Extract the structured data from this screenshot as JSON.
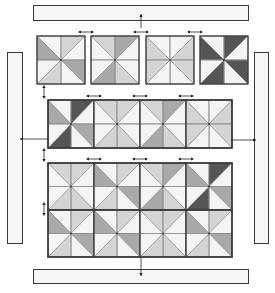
{
  "diagram": {
    "colors": {
      "background": "#ffffff",
      "outline": "#3a3a3a",
      "seam": "#8a8a8a",
      "border_fill": "#f6f6f6",
      "white": "#f4f4f4",
      "light": "#d4d4d4",
      "medium": "#a9a9a9",
      "dark": "#555555",
      "arrow": "#222222"
    },
    "borders": [
      {
        "id": "top-border",
        "x": 33,
        "y": 5,
        "w": 215,
        "h": 15
      },
      {
        "id": "left-border",
        "x": 7,
        "y": 52,
        "w": 15,
        "h": 191
      },
      {
        "id": "right-border",
        "x": 254,
        "y": 52,
        "w": 14,
        "h": 191
      },
      {
        "id": "bottom-border",
        "x": 33,
        "y": 269,
        "w": 215,
        "h": 14
      }
    ],
    "block_rows": [
      {
        "id": "row-1-separate-blocks",
        "y": 36,
        "size": 48,
        "joined": false,
        "blocks": [
          {
            "x": 37,
            "shade": [
              "medium",
              "white",
              "light",
              "white",
              "medium",
              "white",
              "light",
              "white"
            ]
          },
          {
            "x": 91,
            "shade": [
              "white",
              "light",
              "medium",
              "white",
              "white",
              "light",
              "medium",
              "white"
            ]
          },
          {
            "x": 146,
            "shade": [
              "light",
              "white",
              "white",
              "light",
              "light",
              "white",
              "white",
              "light"
            ]
          },
          {
            "x": 200,
            "shade": [
              "dark",
              "white",
              "dark",
              "white",
              "dark",
              "white",
              "dark",
              "white"
            ]
          }
        ]
      },
      {
        "id": "row-2-joined-strip",
        "y": 100,
        "size": 48,
        "joined": true,
        "x": 48,
        "block_w": 46,
        "blocks": [
          {
            "shade": [
              "medium",
              "white",
              "dark",
              "white",
              "medium",
              "white",
              "dark",
              "white"
            ]
          },
          {
            "shade": [
              "white",
              "light",
              "light",
              "white",
              "white",
              "light",
              "light",
              "white"
            ]
          },
          {
            "shade": [
              "white",
              "light",
              "medium",
              "white",
              "white",
              "light",
              "medium",
              "white"
            ]
          },
          {
            "shade": [
              "light",
              "white",
              "white",
              "light",
              "light",
              "white",
              "white",
              "light"
            ]
          }
        ]
      },
      {
        "id": "row-3-joined-strip",
        "y": 163,
        "size": 47,
        "joined": true,
        "x": 48,
        "block_w": 46,
        "blocks": [
          {
            "shade": [
              "white",
              "light",
              "light",
              "white",
              "white",
              "light",
              "light",
              "white"
            ]
          },
          {
            "shade": [
              "medium",
              "white",
              "light",
              "white",
              "medium",
              "white",
              "light",
              "white"
            ]
          },
          {
            "shade": [
              "white",
              "light",
              "medium",
              "white",
              "white",
              "light",
              "medium",
              "white"
            ]
          },
          {
            "shade": [
              "medium",
              "white",
              "dark",
              "white",
              "medium",
              "white",
              "dark",
              "white"
            ]
          }
        ]
      },
      {
        "id": "row-4-joined-strip",
        "y": 210,
        "size": 47,
        "joined": true,
        "x": 48,
        "block_w": 46,
        "blocks": [
          {
            "shade": [
              "medium",
              "white",
              "light",
              "white",
              "medium",
              "white",
              "light",
              "white"
            ]
          },
          {
            "shade": [
              "medium",
              "white",
              "light",
              "white",
              "medium",
              "white",
              "light",
              "white"
            ]
          },
          {
            "shade": [
              "white",
              "light",
              "light",
              "white",
              "white",
              "light",
              "light",
              "white"
            ]
          },
          {
            "shade": [
              "medium",
              "white",
              "light",
              "white",
              "medium",
              "white",
              "light",
              "white"
            ]
          }
        ]
      }
    ],
    "arrows": {
      "horizontal_pairs": [
        {
          "x": 86,
          "y": 32
        },
        {
          "x": 141,
          "y": 32
        },
        {
          "x": 195,
          "y": 32
        },
        {
          "x": 94,
          "y": 96
        },
        {
          "x": 140,
          "y": 96
        },
        {
          "x": 186,
          "y": 96
        },
        {
          "x": 94,
          "y": 159
        },
        {
          "x": 140,
          "y": 159
        },
        {
          "x": 186,
          "y": 159
        }
      ],
      "vertical_pairs": [
        {
          "x": 44,
          "y": 92
        },
        {
          "x": 44,
          "y": 155
        },
        {
          "x": 44,
          "y": 209
        }
      ],
      "border_arrows": [
        {
          "id": "top-join",
          "x1": 141,
          "y1": 28,
          "x2": 141,
          "y2": 14,
          "dir": "up"
        },
        {
          "id": "left-join",
          "x1": 48,
          "y1": 139,
          "x2": 20,
          "y2": 139,
          "dir": "left"
        },
        {
          "id": "right-join",
          "x1": 231,
          "y1": 140,
          "x2": 256,
          "y2": 140,
          "dir": "right"
        },
        {
          "id": "bottom-join",
          "x1": 141,
          "y1": 258,
          "x2": 141,
          "y2": 276,
          "dir": "down"
        }
      ]
    }
  }
}
